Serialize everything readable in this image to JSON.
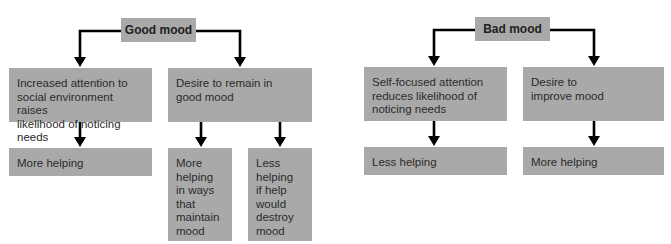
{
  "diagrams": {
    "good_mood": {
      "root": "Good mood",
      "branches": [
        {
          "cause": "Increased attention to social environment raises likelihood of noticing needs",
          "cause_lines": [
            "Increased attention to",
            "social environment raises",
            "likelihood of noticing needs"
          ],
          "outcomes": [
            {
              "label": "More helping"
            }
          ]
        },
        {
          "cause": "Desire to remain in good mood",
          "cause_lines": [
            "Desire to remain in",
            "good mood"
          ],
          "outcomes": [
            {
              "label": "More helping in ways that maintain mood",
              "lines": [
                "More",
                "helping",
                "in ways",
                "that",
                "maintain",
                "mood"
              ]
            },
            {
              "label": "Less helping if help would destroy mood",
              "lines": [
                "Less",
                "helping",
                "if help",
                "would",
                "destroy",
                "mood"
              ]
            }
          ]
        }
      ]
    },
    "bad_mood": {
      "root": "Bad mood",
      "branches": [
        {
          "cause": "Self-focused attention reduces likelihood of noticing needs",
          "cause_lines": [
            "Self-focused attention",
            "reduces likelihood of",
            "noticing needs"
          ],
          "outcomes": [
            {
              "label": "Less helping"
            }
          ]
        },
        {
          "cause": "Desire to improve mood",
          "cause_lines": [
            "Desire to",
            "improve mood"
          ],
          "outcomes": [
            {
              "label": "More helping"
            }
          ]
        }
      ]
    }
  },
  "colors": {
    "box_fill": "#a9a9a9",
    "arrow": "#000000",
    "text": "#2b2b2b"
  }
}
